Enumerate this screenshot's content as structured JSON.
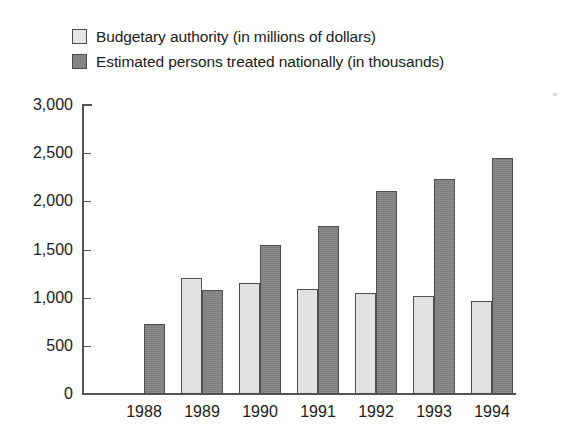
{
  "chart_data": {
    "type": "bar",
    "title": "",
    "subtitle": "",
    "xlabel": "",
    "ylabel": "",
    "categories": [
      "1988",
      "1989",
      "1990",
      "1991",
      "1992",
      "1993",
      "1994"
    ],
    "series": [
      {
        "name": "Budgetary authority (in millions of dollars)",
        "color": "#e6e6e6",
        "values": [
          null,
          1200,
          1150,
          1095,
          1045,
          1020,
          965
        ]
      },
      {
        "name": "Estimated persons treated nationally (in thousands)",
        "color": "#858585",
        "values": [
          730,
          1075,
          1550,
          1745,
          2105,
          2230,
          2450
        ]
      }
    ],
    "ylim": [
      0,
      3000
    ],
    "ytick_labels": [
      "0",
      "500",
      "1,000",
      "1,500",
      "2,000",
      "2,500",
      "3,000"
    ],
    "ytick_values": [
      0,
      500,
      1000,
      1500,
      2000,
      2500,
      3000
    ],
    "grid": false,
    "legend_position": "top-left"
  },
  "legend": {
    "items": [
      {
        "label": "Budgetary authority (in millions of dollars)",
        "swatch": "light-gray-swatch"
      },
      {
        "label": "Estimated persons treated nationally (in thousands)",
        "swatch": "dark-gray-swatch"
      }
    ]
  },
  "colors": {
    "series_light": "#e6e6e6",
    "series_dark": "#858585",
    "axis": "#555555",
    "text": "#202020",
    "background": "#ffffff"
  }
}
